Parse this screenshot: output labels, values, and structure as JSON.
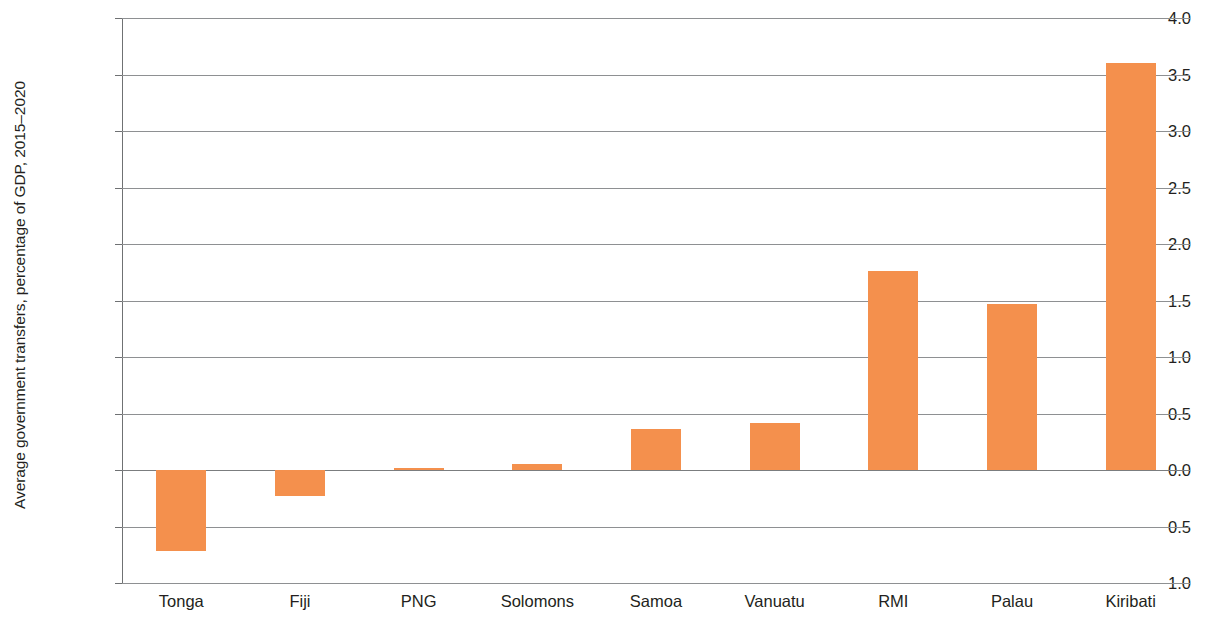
{
  "chart_data": {
    "type": "bar",
    "title": "",
    "xlabel": "",
    "ylabel": "Average government transfers, percentage of GDP, 2015–2020",
    "categories": [
      "Tonga",
      "Fiji",
      "PNG",
      "Solomons",
      "Samoa",
      "Vanuatu",
      "RMI",
      "Palau",
      "Kiribati"
    ],
    "values": [
      -0.72,
      -0.23,
      0.02,
      0.05,
      0.36,
      0.42,
      1.76,
      1.47,
      3.6
    ],
    "ylim": [
      -1.0,
      4.0
    ],
    "ytick_labels": [
      "4.0",
      "3.5",
      "3.0",
      "2.5",
      "2.0",
      "1.5",
      "1.0",
      "0.5",
      "0.0",
      "−0.5",
      "−1.0"
    ],
    "ytick_values": [
      4.0,
      3.5,
      3.0,
      2.5,
      2.0,
      1.5,
      1.0,
      0.5,
      0.0,
      -0.5,
      -1.0
    ],
    "grid": true,
    "legend": false,
    "bar_color": "#f4904d",
    "gridline_color": "#8e9092",
    "axis_color": "#6f7173",
    "text_color": "#231f20"
  }
}
